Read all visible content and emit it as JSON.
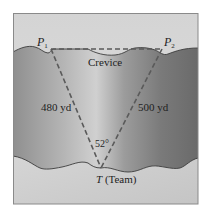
{
  "figure": {
    "type": "geometry-word-problem-diagram",
    "colors": {
      "frame_border": "#8a8a8a",
      "sky": "#d8d8d8",
      "ground_light": "#b9b9b9",
      "ground_dark": "#6e6e6e",
      "rim_line": "#3c3c3c",
      "dashed_line": "#5a5a5a",
      "text": "#1e1e1e"
    },
    "points": [
      {
        "id": "P1",
        "letter": "P",
        "subscript": "1",
        "x": 51,
        "y": 49
      },
      {
        "id": "P2",
        "letter": "P",
        "subscript": "2",
        "x": 162,
        "y": 49
      },
      {
        "id": "T",
        "letter": "T",
        "suffix": "(Team)",
        "x": 101,
        "y": 168
      }
    ],
    "labels": {
      "p1_letter": "P",
      "p1_sub": "1",
      "p2_letter": "P",
      "p2_sub": "2",
      "crevice": "Crevice",
      "left_side": "480 yd",
      "right_side": "500 yd",
      "angle": "52°",
      "team_letter": "T",
      "team_suffix": " (Team)"
    },
    "measurements": {
      "side_TP1_yd": 480,
      "side_TP2_yd": 500,
      "angle_at_T_deg": 52
    }
  }
}
